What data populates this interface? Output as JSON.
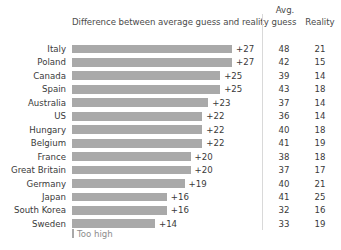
{
  "header": {
    "bar_column_title": "Difference between average guess and reality",
    "avg_line1": "Avg.",
    "avg_line2": "guess",
    "reality": "Reality"
  },
  "legend": {
    "label": "Too high",
    "swatch_name": "too-high-swatch"
  },
  "colors": {
    "bar": "#a9a9a9",
    "text": "#3a3a3a",
    "muted": "#8d8d8d",
    "separator": "#d9d9d9",
    "background": "#ffffff"
  },
  "chart_data": {
    "type": "bar",
    "title": "Difference between average guess and reality",
    "subtitle": "",
    "orientation": "horizontal",
    "xlabel": "",
    "ylabel": "",
    "grid": false,
    "legend_position": "bottom-left",
    "legend_entries": [
      "Too high"
    ],
    "value_prefix": "+",
    "xlim": [
      0,
      27
    ],
    "categories": [
      "Italy",
      "Poland",
      "Canada",
      "Spain",
      "Australia",
      "US",
      "Hungary",
      "Belgium",
      "France",
      "Great Britain",
      "Germany",
      "Japan",
      "South Korea",
      "Sweden"
    ],
    "values": [
      27,
      27,
      25,
      25,
      23,
      22,
      22,
      22,
      20,
      20,
      19,
      16,
      16,
      14
    ],
    "series": [
      {
        "name": "Difference between average guess and reality",
        "values": [
          27,
          27,
          25,
          25,
          23,
          22,
          22,
          22,
          20,
          20,
          19,
          16,
          16,
          14
        ]
      },
      {
        "name": "Avg. guess",
        "values": [
          48,
          42,
          39,
          43,
          37,
          36,
          40,
          41,
          38,
          37,
          40,
          41,
          32,
          33
        ]
      },
      {
        "name": "Reality",
        "values": [
          21,
          15,
          14,
          18,
          14,
          14,
          18,
          19,
          18,
          17,
          21,
          25,
          16,
          19
        ]
      }
    ],
    "rows": [
      {
        "country": "Italy",
        "diff": "+27",
        "diff_value": 27,
        "guess": "48",
        "reality": "21"
      },
      {
        "country": "Poland",
        "diff": "+27",
        "diff_value": 27,
        "guess": "42",
        "reality": "15"
      },
      {
        "country": "Canada",
        "diff": "+25",
        "diff_value": 25,
        "guess": "39",
        "reality": "14"
      },
      {
        "country": "Spain",
        "diff": "+25",
        "diff_value": 25,
        "guess": "43",
        "reality": "18"
      },
      {
        "country": "Australia",
        "diff": "+23",
        "diff_value": 23,
        "guess": "37",
        "reality": "14"
      },
      {
        "country": "US",
        "diff": "+22",
        "diff_value": 22,
        "guess": "36",
        "reality": "14"
      },
      {
        "country": "Hungary",
        "diff": "+22",
        "diff_value": 22,
        "guess": "40",
        "reality": "18"
      },
      {
        "country": "Belgium",
        "diff": "+22",
        "diff_value": 22,
        "guess": "41",
        "reality": "19"
      },
      {
        "country": "France",
        "diff": "+20",
        "diff_value": 20,
        "guess": "38",
        "reality": "18"
      },
      {
        "country": "Great Britain",
        "diff": "+20",
        "diff_value": 20,
        "guess": "37",
        "reality": "17"
      },
      {
        "country": "Germany",
        "diff": "+19",
        "diff_value": 19,
        "guess": "40",
        "reality": "21"
      },
      {
        "country": "Japan",
        "diff": "+16",
        "diff_value": 16,
        "guess": "41",
        "reality": "25"
      },
      {
        "country": "South Korea",
        "diff": "+16",
        "diff_value": 16,
        "guess": "32",
        "reality": "16"
      },
      {
        "country": "Sweden",
        "diff": "+14",
        "diff_value": 14,
        "guess": "33",
        "reality": "19"
      }
    ]
  }
}
